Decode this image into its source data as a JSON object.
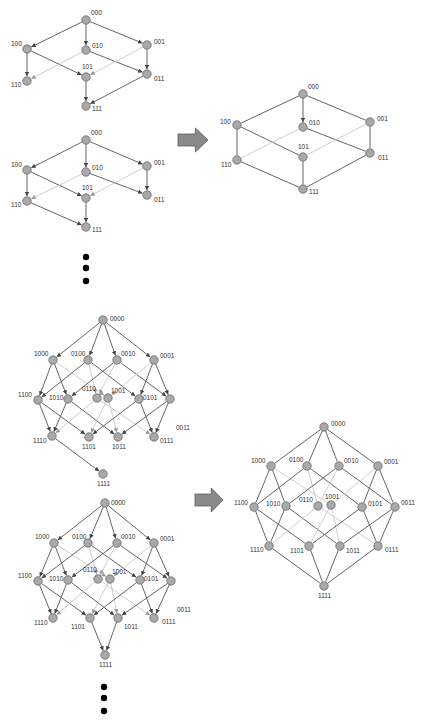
{
  "colors": {
    "node_fill": "#a9a9a9",
    "node_stroke": "#6a6a6a",
    "edge": "#555555",
    "hidden_edge": "#c8c8c8",
    "arrow": "#8a8a8a"
  },
  "graphs": [
    {
      "id": "q3-directed-a",
      "directed": true,
      "nodes": [
        {
          "id": "000",
          "x": 86,
          "y": 20,
          "lx": 91,
          "ly": 15
        },
        {
          "id": "100",
          "x": 27,
          "y": 49,
          "lx": 11,
          "ly": 46
        },
        {
          "id": "010",
          "x": 86,
          "y": 50,
          "lx": 92,
          "ly": 48
        },
        {
          "id": "001",
          "x": 147,
          "y": 45,
          "lx": 154,
          "ly": 44
        },
        {
          "id": "110",
          "x": 27,
          "y": 81,
          "lx": 11,
          "ly": 87
        },
        {
          "id": "101",
          "x": 86,
          "y": 77,
          "lx": 82,
          "ly": 69
        },
        {
          "id": "011",
          "x": 147,
          "y": 74,
          "lx": 154,
          "ly": 81
        },
        {
          "id": "111",
          "x": 86,
          "y": 106,
          "lx": 92,
          "ly": 111
        }
      ],
      "edges": [
        [
          "000",
          "100"
        ],
        [
          "000",
          "010"
        ],
        [
          "000",
          "001"
        ],
        [
          "100",
          "110"
        ],
        [
          "100",
          "101"
        ],
        [
          "010",
          "011"
        ],
        [
          "010",
          "110",
          1
        ],
        [
          "001",
          "011"
        ],
        [
          "001",
          "101",
          1
        ],
        [
          "101",
          "111"
        ],
        [
          "011",
          "111"
        ]
      ]
    },
    {
      "id": "q3-directed-b",
      "directed": true,
      "nodes": [
        {
          "id": "000",
          "x": 86,
          "y": 140,
          "lx": 91,
          "ly": 135
        },
        {
          "id": "100",
          "x": 27,
          "y": 170,
          "lx": 11,
          "ly": 167
        },
        {
          "id": "010",
          "x": 86,
          "y": 172,
          "lx": 92,
          "ly": 170
        },
        {
          "id": "001",
          "x": 147,
          "y": 166,
          "lx": 154,
          "ly": 165
        },
        {
          "id": "110",
          "x": 27,
          "y": 201,
          "lx": 11,
          "ly": 207
        },
        {
          "id": "101",
          "x": 86,
          "y": 198,
          "lx": 82,
          "ly": 190
        },
        {
          "id": "011",
          "x": 147,
          "y": 195,
          "lx": 154,
          "ly": 202
        },
        {
          "id": "111",
          "x": 86,
          "y": 227,
          "lx": 92,
          "ly": 232
        }
      ],
      "edges": [
        [
          "000",
          "100"
        ],
        [
          "000",
          "010"
        ],
        [
          "000",
          "001"
        ],
        [
          "100",
          "110"
        ],
        [
          "100",
          "101"
        ],
        [
          "010",
          "011"
        ],
        [
          "010",
          "110",
          1
        ],
        [
          "001",
          "011"
        ],
        [
          "001",
          "101",
          1
        ],
        [
          "101",
          "111"
        ],
        [
          "110",
          "111"
        ]
      ]
    },
    {
      "id": "q3-undirected",
      "directed": false,
      "nodes": [
        {
          "id": "000",
          "x": 303,
          "y": 94,
          "lx": 308,
          "ly": 89
        },
        {
          "id": "100",
          "x": 237,
          "y": 125,
          "lx": 220,
          "ly": 124
        },
        {
          "id": "010",
          "x": 303,
          "y": 127,
          "lx": 309,
          "ly": 125
        },
        {
          "id": "001",
          "x": 370,
          "y": 122,
          "lx": 377,
          "ly": 121
        },
        {
          "id": "110",
          "x": 237,
          "y": 160,
          "lx": 221,
          "ly": 167
        },
        {
          "id": "101",
          "x": 303,
          "y": 157,
          "lx": 298,
          "ly": 149
        },
        {
          "id": "011",
          "x": 370,
          "y": 153,
          "lx": 378,
          "ly": 160
        },
        {
          "id": "111",
          "x": 303,
          "y": 189,
          "lx": 309,
          "ly": 194
        }
      ],
      "edges": [
        [
          "000",
          "100"
        ],
        [
          "000",
          "010",
          0,
          1
        ],
        [
          "000",
          "001"
        ],
        [
          "100",
          "110"
        ],
        [
          "100",
          "101"
        ],
        [
          "010",
          "011"
        ],
        [
          "010",
          "110",
          1
        ],
        [
          "001",
          "011"
        ],
        [
          "001",
          "101",
          1
        ],
        [
          "101",
          "111"
        ],
        [
          "110",
          "111"
        ],
        [
          "011",
          "111"
        ]
      ]
    },
    {
      "id": "q4-directed-a",
      "directed": true,
      "nodes": [
        {
          "id": "0000",
          "x": 103,
          "y": 320,
          "lx": 110,
          "ly": 321
        },
        {
          "id": "1000",
          "x": 53,
          "y": 360,
          "lx": 34,
          "ly": 356
        },
        {
          "id": "0100",
          "x": 88,
          "y": 360,
          "lx": 71,
          "ly": 356
        },
        {
          "id": "0010",
          "x": 117,
          "y": 360,
          "lx": 121,
          "ly": 356
        },
        {
          "id": "0001",
          "x": 154,
          "y": 360,
          "lx": 160,
          "ly": 358
        },
        {
          "id": "1100",
          "x": 38,
          "y": 400,
          "lx": 18,
          "ly": 397
        },
        {
          "id": "1010",
          "x": 68,
          "y": 399,
          "lx": 49,
          "ly": 400
        },
        {
          "id": "0110",
          "x": 97,
          "y": 398,
          "lx": 82,
          "ly": 391
        },
        {
          "id": "1001",
          "x": 108,
          "y": 398,
          "lx": 111,
          "ly": 393
        },
        {
          "id": "0101",
          "x": 139,
          "y": 399,
          "lx": 143,
          "ly": 400
        },
        {
          "id": "0011",
          "x": 170,
          "y": 399,
          "lx": 176,
          "ly": 430
        },
        {
          "id": "1110",
          "x": 52,
          "y": 436,
          "lx": 33,
          "ly": 443
        },
        {
          "id": "1101",
          "x": 89,
          "y": 437,
          "lx": 82,
          "ly": 449
        },
        {
          "id": "1011",
          "x": 118,
          "y": 437,
          "lx": 112,
          "ly": 449
        },
        {
          "id": "0111",
          "x": 154,
          "y": 437,
          "lx": 160,
          "ly": 443
        },
        {
          "id": "1111",
          "x": 103,
          "y": 474,
          "lx": 97,
          "ly": 486
        }
      ],
      "edges": [
        [
          "0000",
          "1000"
        ],
        [
          "0000",
          "0100"
        ],
        [
          "0000",
          "0010"
        ],
        [
          "0000",
          "0001"
        ],
        [
          "1000",
          "1100"
        ],
        [
          "1000",
          "1010"
        ],
        [
          "1000",
          "1001",
          1
        ],
        [
          "0100",
          "1100"
        ],
        [
          "0100",
          "0101"
        ],
        [
          "0100",
          "0110",
          1
        ],
        [
          "0010",
          "1010"
        ],
        [
          "0010",
          "0011"
        ],
        [
          "0010",
          "0110",
          1
        ],
        [
          "0001",
          "0101"
        ],
        [
          "0001",
          "0011"
        ],
        [
          "0001",
          "1001",
          1
        ],
        [
          "1100",
          "1110"
        ],
        [
          "1100",
          "1101"
        ],
        [
          "1010",
          "1110"
        ],
        [
          "1010",
          "1011"
        ],
        [
          "0110",
          "1110",
          1
        ],
        [
          "0110",
          "0111",
          1
        ],
        [
          "1001",
          "1101",
          1
        ],
        [
          "1001",
          "1011",
          1
        ],
        [
          "0101",
          "1101"
        ],
        [
          "0101",
          "0111"
        ],
        [
          "0011",
          "1011"
        ],
        [
          "0011",
          "0111"
        ],
        [
          "1110",
          "1111"
        ]
      ]
    },
    {
      "id": "q4-directed-b",
      "directed": true,
      "nodes": [
        {
          "id": "0000",
          "x": 105,
          "y": 503,
          "lx": 111,
          "ly": 505
        },
        {
          "id": "1000",
          "x": 54,
          "y": 543,
          "lx": 35,
          "ly": 539
        },
        {
          "id": "0100",
          "x": 88,
          "y": 543,
          "lx": 72,
          "ly": 539
        },
        {
          "id": "0010",
          "x": 117,
          "y": 543,
          "lx": 121,
          "ly": 539
        },
        {
          "id": "0001",
          "x": 154,
          "y": 543,
          "lx": 160,
          "ly": 541
        },
        {
          "id": "1100",
          "x": 38,
          "y": 581,
          "lx": 18,
          "ly": 578
        },
        {
          "id": "1010",
          "x": 68,
          "y": 580,
          "lx": 49,
          "ly": 581
        },
        {
          "id": "0110",
          "x": 98,
          "y": 579,
          "lx": 83,
          "ly": 572
        },
        {
          "id": "1001",
          "x": 110,
          "y": 579,
          "lx": 112,
          "ly": 574
        },
        {
          "id": "0101",
          "x": 140,
          "y": 580,
          "lx": 144,
          "ly": 581
        },
        {
          "id": "0011",
          "x": 171,
          "y": 581,
          "lx": 177,
          "ly": 612
        },
        {
          "id": "1110",
          "x": 53,
          "y": 618,
          "lx": 34,
          "ly": 625
        },
        {
          "id": "1101",
          "x": 90,
          "y": 618,
          "lx": 71,
          "ly": 629
        },
        {
          "id": "1011",
          "x": 118,
          "y": 618,
          "lx": 124,
          "ly": 629
        },
        {
          "id": "0111",
          "x": 154,
          "y": 618,
          "lx": 162,
          "ly": 624
        },
        {
          "id": "1111",
          "x": 105,
          "y": 655,
          "lx": 99,
          "ly": 667
        }
      ],
      "edges": [
        [
          "0000",
          "1000"
        ],
        [
          "0000",
          "0100"
        ],
        [
          "0000",
          "0010"
        ],
        [
          "0000",
          "0001"
        ],
        [
          "1000",
          "1100"
        ],
        [
          "1000",
          "1010"
        ],
        [
          "1000",
          "1001",
          1
        ],
        [
          "0100",
          "1100"
        ],
        [
          "0100",
          "0101"
        ],
        [
          "0100",
          "0110",
          1
        ],
        [
          "0010",
          "1010"
        ],
        [
          "0010",
          "0011"
        ],
        [
          "0010",
          "0110",
          1
        ],
        [
          "0001",
          "0101"
        ],
        [
          "0001",
          "0011"
        ],
        [
          "0001",
          "1001",
          1
        ],
        [
          "1100",
          "1110"
        ],
        [
          "1100",
          "1101"
        ],
        [
          "1010",
          "1110"
        ],
        [
          "1010",
          "1011"
        ],
        [
          "0110",
          "1110",
          1
        ],
        [
          "0110",
          "0111",
          1
        ],
        [
          "1001",
          "1101",
          1
        ],
        [
          "1001",
          "1011",
          1
        ],
        [
          "0101",
          "1101"
        ],
        [
          "0101",
          "0111"
        ],
        [
          "0011",
          "1011"
        ],
        [
          "0011",
          "0111"
        ],
        [
          "1101",
          "1111"
        ],
        [
          "1011",
          "1111"
        ]
      ]
    },
    {
      "id": "q4-undirected",
      "directed": false,
      "nodes": [
        {
          "id": "0000",
          "x": 324,
          "y": 427,
          "lx": 331,
          "ly": 426
        },
        {
          "id": "1000",
          "x": 271,
          "y": 466,
          "lx": 251,
          "ly": 463
        },
        {
          "id": "0100",
          "x": 307,
          "y": 466,
          "lx": 289,
          "ly": 462
        },
        {
          "id": "0010",
          "x": 339,
          "y": 466,
          "lx": 344,
          "ly": 463
        },
        {
          "id": "0001",
          "x": 378,
          "y": 466,
          "lx": 384,
          "ly": 464
        },
        {
          "id": "1100",
          "x": 254,
          "y": 507,
          "lx": 234,
          "ly": 505
        },
        {
          "id": "1010",
          "x": 286,
          "y": 506,
          "lx": 266,
          "ly": 506
        },
        {
          "id": "0110",
          "x": 318,
          "y": 506,
          "lx": 299,
          "ly": 502
        },
        {
          "id": "1001",
          "x": 331,
          "y": 505,
          "lx": 325,
          "ly": 499
        },
        {
          "id": "0101",
          "x": 362,
          "y": 507,
          "lx": 368,
          "ly": 506
        },
        {
          "id": "0011",
          "x": 395,
          "y": 507,
          "lx": 401,
          "ly": 505
        },
        {
          "id": "1110",
          "x": 269,
          "y": 546,
          "lx": 250,
          "ly": 552
        },
        {
          "id": "1101",
          "x": 309,
          "y": 546,
          "lx": 290,
          "ly": 553
        },
        {
          "id": "1011",
          "x": 340,
          "y": 546,
          "lx": 346,
          "ly": 553
        },
        {
          "id": "0111",
          "x": 378,
          "y": 546,
          "lx": 385,
          "ly": 552
        },
        {
          "id": "1111",
          "x": 324,
          "y": 586,
          "lx": 318,
          "ly": 598
        }
      ],
      "edges": [
        [
          "0000",
          "1000"
        ],
        [
          "0000",
          "0100"
        ],
        [
          "0000",
          "0010"
        ],
        [
          "0000",
          "0001"
        ],
        [
          "1000",
          "1100"
        ],
        [
          "1000",
          "1010"
        ],
        [
          "1000",
          "1001",
          1
        ],
        [
          "0100",
          "1100"
        ],
        [
          "0100",
          "0101"
        ],
        [
          "0100",
          "0110",
          1
        ],
        [
          "0010",
          "1010"
        ],
        [
          "0010",
          "0011"
        ],
        [
          "0010",
          "0110",
          1
        ],
        [
          "0001",
          "0101"
        ],
        [
          "0001",
          "0011"
        ],
        [
          "0001",
          "1001",
          1
        ],
        [
          "1100",
          "1110"
        ],
        [
          "1100",
          "1101"
        ],
        [
          "1010",
          "1110"
        ],
        [
          "1010",
          "1011"
        ],
        [
          "0110",
          "1110",
          1
        ],
        [
          "0110",
          "0111",
          1
        ],
        [
          "1001",
          "1101",
          1
        ],
        [
          "1001",
          "1011",
          1
        ],
        [
          "0101",
          "1101"
        ],
        [
          "0101",
          "0111"
        ],
        [
          "0011",
          "1011"
        ],
        [
          "0011",
          "0111"
        ],
        [
          "1110",
          "1111"
        ],
        [
          "1101",
          "1111"
        ],
        [
          "1011",
          "1111"
        ],
        [
          "0111",
          "1111"
        ]
      ]
    }
  ],
  "arrows": [
    {
      "id": "arrow-q3",
      "x": 178,
      "y": 128,
      "w": 30,
      "h": 24
    },
    {
      "id": "arrow-q4",
      "x": 195,
      "y": 488,
      "w": 28,
      "h": 24
    }
  ],
  "ellipses": [
    {
      "id": "ellipsis-q3",
      "x": 86,
      "dots": [
        257,
        268,
        281
      ]
    },
    {
      "id": "ellipsis-q4",
      "x": 104,
      "dots": [
        687,
        698,
        711
      ]
    }
  ]
}
